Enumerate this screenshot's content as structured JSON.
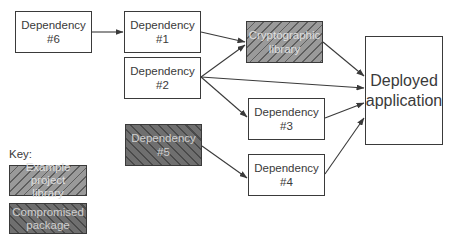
{
  "diagram": {
    "nodes": [
      {
        "id": "dep6",
        "line1": "Dependency",
        "line2": "#6",
        "type": "normal"
      },
      {
        "id": "dep1",
        "line1": "Dependency",
        "line2": "#1",
        "type": "normal"
      },
      {
        "id": "dep2",
        "line1": "Dependency",
        "line2": "#2",
        "type": "normal"
      },
      {
        "id": "crypto",
        "line1": "Cryptographic",
        "line2": "library",
        "type": "example-project-library"
      },
      {
        "id": "dep3",
        "line1": "Dependency",
        "line2": "#3",
        "type": "normal"
      },
      {
        "id": "dep5",
        "line1": "Dependency",
        "line2": "#5",
        "type": "compromised-package"
      },
      {
        "id": "dep4",
        "line1": "Dependency",
        "line2": "#4",
        "type": "normal"
      },
      {
        "id": "app",
        "line1": "Deployed",
        "line2": "application",
        "type": "normal"
      }
    ],
    "edges": [
      {
        "from": "dep6",
        "to": "dep1"
      },
      {
        "from": "dep1",
        "to": "crypto"
      },
      {
        "from": "dep2",
        "to": "crypto"
      },
      {
        "from": "dep2",
        "to": "app"
      },
      {
        "from": "dep2",
        "to": "dep3"
      },
      {
        "from": "crypto",
        "to": "app"
      },
      {
        "from": "dep3",
        "to": "app"
      },
      {
        "from": "dep5",
        "to": "dep4"
      },
      {
        "from": "dep4",
        "to": "app"
      }
    ]
  },
  "key": {
    "title": "Key:",
    "items": [
      {
        "line1": "Example project",
        "line2": "library",
        "type": "example-project-library"
      },
      {
        "line1": "Compromised",
        "line2": "package",
        "type": "compromised-package"
      }
    ]
  },
  "colors": {
    "stroke": "#3a3a3a",
    "example_fill": "#9a9a9a",
    "compromised_fill": "#6f6f6f"
  }
}
